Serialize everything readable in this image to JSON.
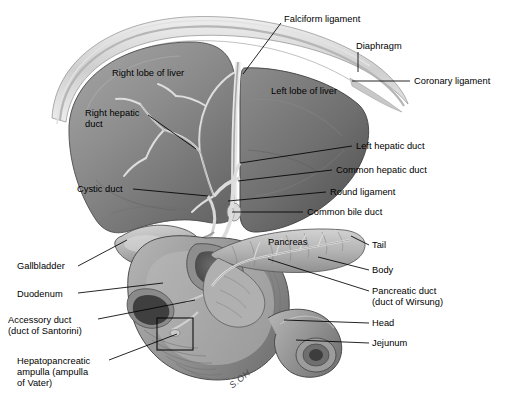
{
  "figure": {
    "background_color": "#ffffff",
    "line_color": "#000000",
    "signature": "S.OH"
  },
  "palette": {
    "liver_light": "#9a9a9a",
    "liver_mid": "#7e7e7e",
    "liver_dark": "#5f5f5f",
    "left_lobe": "#6b6b6b",
    "diaphragm": "#cfcfcf",
    "duct": "#e8e8e8",
    "pancreas": "#b8b8b8",
    "duodenum": "#a7a7a7",
    "gallbladder": "#bdbdbd",
    "outline": "#3a3a3a"
  },
  "labels": [
    {
      "id": "falciform-ligament",
      "text": "Falciform ligament",
      "x": 284,
      "y": 14,
      "lx1": 281,
      "ly1": 23,
      "lx2": 243,
      "ly2": 74
    },
    {
      "id": "diaphragm",
      "text": "Diaphragm",
      "x": 356,
      "y": 41,
      "lx1": 358,
      "ly1": 52,
      "lx2": 358,
      "ly2": 72
    },
    {
      "id": "coronary-ligament",
      "text": "Coronary ligament",
      "x": 414,
      "y": 76,
      "lx1": 410,
      "ly1": 81,
      "lx2": 352,
      "ly2": 81
    },
    {
      "id": "right-lobe-of-liver",
      "text": "Right lobe of liver",
      "x": 112,
      "y": 68,
      "lx1": 0,
      "ly1": 0,
      "lx2": 0,
      "ly2": 0
    },
    {
      "id": "left-lobe-of-liver",
      "text": "Left lobe of liver",
      "x": 271,
      "y": 86,
      "lx1": 0,
      "ly1": 0,
      "lx2": 0,
      "ly2": 0
    },
    {
      "id": "right-hepatic-duct",
      "text": "Right hepatic\nduct",
      "x": 85,
      "y": 108,
      "lx1": 148,
      "ly1": 115,
      "lx2": 196,
      "ly2": 149
    },
    {
      "id": "left-hepatic-duct",
      "text": "Left hepatic duct",
      "x": 356,
      "y": 141,
      "lx1": 352,
      "ly1": 146,
      "lx2": 240,
      "ly2": 163
    },
    {
      "id": "common-hepatic-duct",
      "text": "Common hepatic duct",
      "x": 336,
      "y": 165,
      "lx1": 332,
      "ly1": 170,
      "lx2": 238,
      "ly2": 181
    },
    {
      "id": "round-ligament",
      "text": "Round ligament",
      "x": 330,
      "y": 187,
      "lx1": 326,
      "ly1": 192,
      "lx2": 228,
      "ly2": 201
    },
    {
      "id": "cystic-duct",
      "text": "Cystic duct",
      "x": 77,
      "y": 184,
      "lx1": 133,
      "ly1": 189,
      "lx2": 208,
      "ly2": 196
    },
    {
      "id": "common-bile-duct",
      "text": "Common bile duct",
      "x": 307,
      "y": 207,
      "lx1": 303,
      "ly1": 212,
      "lx2": 232,
      "ly2": 212
    },
    {
      "id": "pancreas",
      "text": "Pancreas",
      "x": 268,
      "y": 237,
      "lx1": 0,
      "ly1": 0,
      "lx2": 0,
      "ly2": 0
    },
    {
      "id": "tail",
      "text": "Tail",
      "x": 372,
      "y": 240,
      "lx1": 369,
      "ly1": 245,
      "lx2": 351,
      "ly2": 236
    },
    {
      "id": "body",
      "text": "Body",
      "x": 372,
      "y": 265,
      "lx1": 369,
      "ly1": 270,
      "lx2": 318,
      "ly2": 257
    },
    {
      "id": "pancreatic-duct",
      "text": "Pancreatic duct\n(duct of Wirsung)",
      "x": 372,
      "y": 286,
      "lx1": 369,
      "ly1": 291,
      "lx2": 268,
      "ly2": 259
    },
    {
      "id": "head",
      "text": "Head",
      "x": 372,
      "y": 318,
      "lx1": 369,
      "ly1": 323,
      "lx2": 284,
      "ly2": 320
    },
    {
      "id": "jejunum",
      "text": "Jejunum",
      "x": 372,
      "y": 338,
      "lx1": 369,
      "ly1": 343,
      "lx2": 296,
      "ly2": 340
    },
    {
      "id": "gallbladder",
      "text": "Gallbladder",
      "x": 17,
      "y": 261,
      "lx1": 78,
      "ly1": 266,
      "lx2": 127,
      "ly2": 240
    },
    {
      "id": "duodenum",
      "text": "Duodenum",
      "x": 17,
      "y": 289,
      "lx1": 78,
      "ly1": 293,
      "lx2": 163,
      "ly2": 283
    },
    {
      "id": "accessory-duct",
      "text": "Accessory duct\n(duct of Santorini)",
      "x": 8,
      "y": 315,
      "lx1": 98,
      "ly1": 319,
      "lx2": 195,
      "ly2": 300
    },
    {
      "id": "hepatopancreatic-ampulla",
      "text": "Hepatopancreatic\nampulla (ampulla\nof Vater)",
      "x": 17,
      "y": 356,
      "lx1": 109,
      "ly1": 360,
      "lx2": 177,
      "ly2": 334
    }
  ],
  "inset_box": {
    "x": 157,
    "y": 318,
    "width": 36,
    "height": 32
  }
}
